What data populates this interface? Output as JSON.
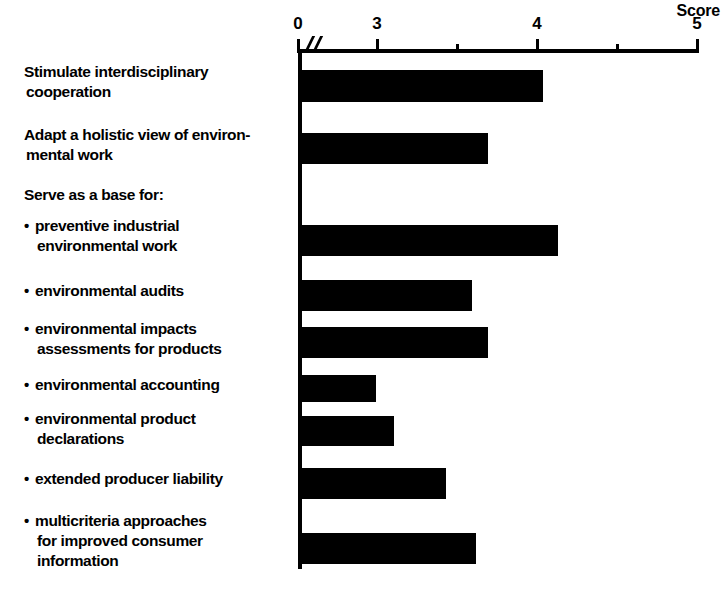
{
  "chart": {
    "type": "bar",
    "orientation": "horizontal",
    "axis_title": "Score",
    "tick_labels": [
      "0",
      "3",
      "4",
      "5"
    ],
    "bullet_glyph": "•"
  },
  "chart_data": {
    "type": "bar",
    "title": "",
    "xlabel": "Score",
    "ylabel": "",
    "orientation": "horizontal",
    "xlim": [
      0,
      5
    ],
    "axis_break": true,
    "axis_break_note": "x-axis broken between 0 and 3",
    "grid": false,
    "legend": null,
    "labeled_ticks": [
      0,
      3,
      4,
      5
    ],
    "minor_ticks": [
      3.5,
      4.5
    ],
    "categories": [
      "Stimulate interdisciplinary cooperation",
      "Adapt a holistic view of environmental work",
      "Serve as a base for:",
      "preventive industrial environmental work",
      "environmental audits",
      "environmental impacts assessments for products",
      "environmental accounting",
      "environmental product declarations",
      "extended producer liability",
      "multicriteria approaches for improved consumer information"
    ],
    "values": [
      4.05,
      3.7,
      null,
      4.15,
      3.6,
      3.7,
      3.0,
      3.1,
      3.45,
      3.6
    ]
  },
  "rows": [
    {
      "lines": [
        "Stimulate interdisciplinary",
        "cooperation"
      ],
      "bulleted": false,
      "value": 4.05,
      "top": 62,
      "bar": {
        "top": 70,
        "height": 32,
        "width": 243
      }
    },
    {
      "lines": [
        "Adapt a holistic view of environ-",
        "mental work"
      ],
      "bulleted": false,
      "value": 3.7,
      "top": 125,
      "bar": {
        "top": 133,
        "height": 31,
        "width": 188
      }
    },
    {
      "lines": [
        "Serve as a base for:"
      ],
      "bulleted": false,
      "value": null,
      "top": 185,
      "bar": null
    },
    {
      "lines": [
        "preventive industrial",
        "environmental work"
      ],
      "bulleted": true,
      "value": 4.15,
      "top": 216,
      "bar": {
        "top": 225,
        "height": 31,
        "width": 258
      }
    },
    {
      "lines": [
        "environmental audits"
      ],
      "bulleted": true,
      "value": 3.6,
      "top": 281,
      "bar": {
        "top": 280,
        "height": 31,
        "width": 172
      }
    },
    {
      "lines": [
        "environmental impacts",
        "assessments for products"
      ],
      "bulleted": true,
      "value": 3.7,
      "top": 319,
      "bar": {
        "top": 327,
        "height": 31,
        "width": 188
      }
    },
    {
      "lines": [
        "environmental accounting"
      ],
      "bulleted": true,
      "value": 3.0,
      "top": 375,
      "bar": {
        "top": 375,
        "height": 27,
        "width": 76
      }
    },
    {
      "lines": [
        "environmental product",
        "declarations"
      ],
      "bulleted": true,
      "value": 3.1,
      "top": 409,
      "bar": {
        "top": 416,
        "height": 30,
        "width": 94
      }
    },
    {
      "lines": [
        "extended producer liability"
      ],
      "bulleted": true,
      "value": 3.45,
      "top": 469,
      "bar": {
        "top": 468,
        "height": 31,
        "width": 146
      }
    },
    {
      "lines": [
        "multicriteria approaches",
        "for improved consumer",
        "information"
      ],
      "bulleted": true,
      "value": 3.6,
      "top": 511,
      "bar": {
        "top": 533,
        "height": 31,
        "width": 176
      }
    }
  ],
  "ticks": [
    {
      "label": "0",
      "x": 298,
      "major": true
    },
    {
      "label": "3",
      "x": 377,
      "major": true
    },
    {
      "label": "",
      "x": 457,
      "major": false
    },
    {
      "label": "4",
      "x": 537,
      "major": true
    },
    {
      "label": "",
      "x": 617,
      "major": false
    },
    {
      "label": "5",
      "x": 697,
      "major": true
    }
  ]
}
